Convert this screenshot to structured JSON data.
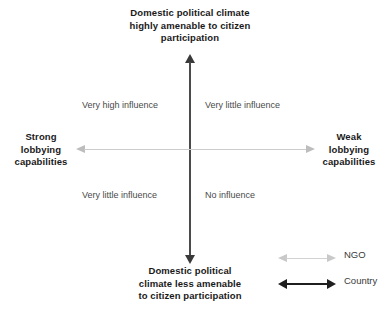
{
  "chart_data": {
    "type": "scatter",
    "title": "",
    "subtitle": "",
    "xlabel": "Lobbying capabilities",
    "ylabel": "Domestic political climate amenability to citizen participation",
    "grid": false,
    "legend_position": "bottom-right",
    "axes": {
      "vertical": {
        "top_label": {
          "line1": "Domestic political climate",
          "line2": "highly amenable to citizen",
          "line3": "participation"
        },
        "bottom_label": {
          "line1": "Domestic political",
          "line2": "climate less amenable",
          "line3": "to citizen participation"
        },
        "color": "#3a3a3a",
        "arrows": "both"
      },
      "horizontal": {
        "left_label": {
          "line1": "Strong",
          "line2": "lobbying",
          "line3": "capabilities"
        },
        "right_label": {
          "line1": "Weak",
          "line2": "lobbying",
          "line3": "capabilities"
        },
        "color": "#cccccc",
        "arrows": "both"
      }
    },
    "quadrants": [
      {
        "position": "top-left",
        "label": "Very high influence"
      },
      {
        "position": "top-right",
        "label": "Very little influence"
      },
      {
        "position": "bottom-left",
        "label": "Very little influence"
      },
      {
        "position": "bottom-right",
        "label": "No influence"
      }
    ],
    "legend": [
      {
        "name": "NGO",
        "color": "#c9c9c9",
        "style": "double-arrow-light"
      },
      {
        "name": "Country",
        "color": "#1f1f1f",
        "style": "double-arrow-dark"
      }
    ]
  }
}
